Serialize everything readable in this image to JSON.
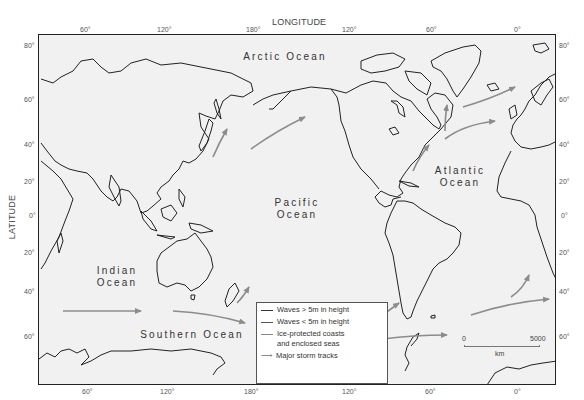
{
  "map": {
    "axes": {
      "x_title": "LONGITUDE",
      "y_title": "LATITUDE",
      "top_ticks": [
        "60°",
        "120°",
        "180°",
        "120°",
        "60°",
        "0°"
      ],
      "bottom_ticks": [
        "60°",
        "120°",
        "180°",
        "120°",
        "60°",
        "0°"
      ],
      "left_ticks": [
        "80°",
        "60°",
        "40°",
        "20°",
        "0°",
        "20°",
        "40°",
        "60°"
      ],
      "right_ticks": [
        "80°",
        "60°",
        "40°",
        "20°",
        "0°",
        "20°",
        "40°",
        "60°"
      ]
    },
    "oceans": {
      "arctic": "Arctic Ocean",
      "pacific_1": "Pacific",
      "pacific_2": "Ocean",
      "atlantic_1": "Atlantic",
      "atlantic_2": "Ocean",
      "indian_1": "Indian",
      "indian_2": "Ocean",
      "southern": "Southern Ocean"
    },
    "legend": {
      "items": [
        {
          "label": "Waves > 5m in height",
          "color": "#333333"
        },
        {
          "label": "Waves < 5m in height",
          "color": "#555555"
        },
        {
          "label_1": "Ice-protected coasts",
          "label_2": "and enclosed seas",
          "color": "#888888"
        },
        {
          "label": "Major storm tracks",
          "color": "#8a8a8a"
        }
      ]
    },
    "scale_bar": {
      "start": "0",
      "end": "5000",
      "unit": "km"
    },
    "colors": {
      "coast": "#222222",
      "storm_track": "#8c8c8c",
      "background": "#f1f1f1"
    }
  }
}
